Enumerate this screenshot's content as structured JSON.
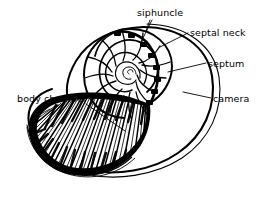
{
  "figure": {
    "background_color": "#ffffff",
    "ink_color": "#000000",
    "width": 263,
    "height": 198
  },
  "labels": [
    {
      "id": "siphuncle",
      "text": "siphuncle",
      "x": 137,
      "y": 8,
      "anchor": "below-left"
    },
    {
      "id": "septal_neck",
      "text": "septal neck",
      "x": 190,
      "y": 28,
      "anchor": "left"
    },
    {
      "id": "septum",
      "text": "septum",
      "x": 208,
      "y": 59,
      "anchor": "left"
    },
    {
      "id": "camera",
      "text": "camera",
      "x": 213,
      "y": 94,
      "anchor": "left"
    },
    {
      "id": "body_chamber",
      "text": "body chamber",
      "x": 17,
      "y": 94,
      "anchor": "right"
    }
  ],
  "parts": {
    "outer_whorl": "double-line shell wall",
    "spiral": "logarithmic coil, about 3.5 whorls",
    "septa_count": 14,
    "siphuncle": "beaded tube along inner margin of whorl",
    "body_chamber": "radially hatched final chamber"
  }
}
